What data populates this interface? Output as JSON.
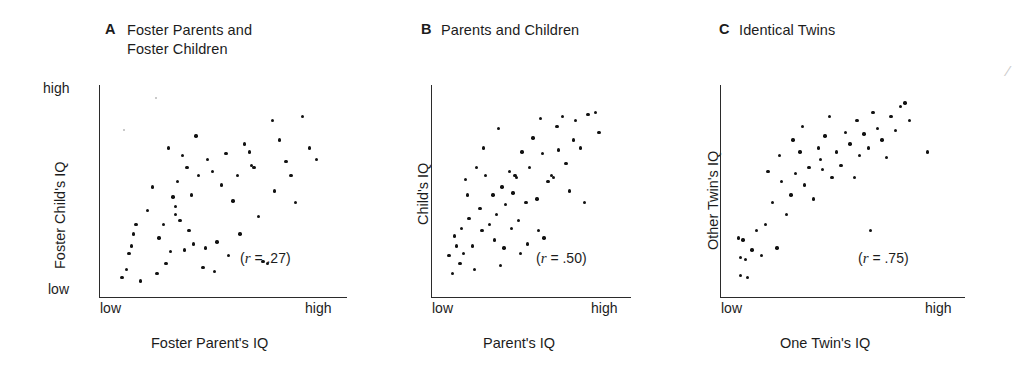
{
  "figure": {
    "background": "#ffffff",
    "ink_color": "#111111"
  },
  "panels": [
    {
      "letter": "A",
      "title": "Foster Parents and\nFoster Children",
      "ylabel": "Foster Child's IQ",
      "xlabel": "Foster Parent's IQ",
      "y_high": "high",
      "y_low": "low",
      "x_low": "low",
      "x_high": "high",
      "r_text": "(r = .27)",
      "r_value": ".27"
    },
    {
      "letter": "B",
      "title": "Parents and Children",
      "ylabel": "Child's IQ",
      "xlabel": "Parent's IQ",
      "y_high": "",
      "y_low": "",
      "x_low": "low",
      "x_high": "high",
      "r_text": "(r = .50)",
      "r_value": ".50"
    },
    {
      "letter": "C",
      "title": "Identical Twins",
      "ylabel": "Other Twin's IQ",
      "xlabel": "One Twin's IQ",
      "y_high": "",
      "y_low": "",
      "x_low": "low",
      "x_high": "high",
      "r_text": "(r = .75)",
      "r_value": ".75"
    }
  ],
  "chart_data": [
    {
      "type": "scatter",
      "panel": "A",
      "title": "Foster Parents and Foster Children",
      "xlabel": "Foster Parent's IQ",
      "ylabel": "Foster Child's IQ",
      "xlim": [
        0,
        1
      ],
      "ylim": [
        0,
        1
      ],
      "xtick_labels": [
        "low",
        "high"
      ],
      "ytick_labels": [
        "low",
        "high"
      ],
      "grid": false,
      "legend": "none",
      "annotation": "(r = .27)",
      "correlation": 0.27,
      "n": 56,
      "points": [
        [
          0.13,
          0.33
        ],
        [
          0.09,
          0.1
        ],
        [
          0.07,
          0.06
        ],
        [
          0.11,
          0.22
        ],
        [
          0.1,
          0.18
        ],
        [
          0.12,
          0.28
        ],
        [
          0.15,
          0.04
        ],
        [
          0.25,
          0.33
        ],
        [
          0.2,
          0.52
        ],
        [
          0.29,
          0.47
        ],
        [
          0.23,
          0.26
        ],
        [
          0.26,
          0.13
        ],
        [
          0.27,
          0.72
        ],
        [
          0.33,
          0.68
        ],
        [
          0.35,
          0.62
        ],
        [
          0.31,
          0.55
        ],
        [
          0.3,
          0.42
        ],
        [
          0.3,
          0.38
        ],
        [
          0.32,
          0.35
        ],
        [
          0.36,
          0.3
        ],
        [
          0.4,
          0.58
        ],
        [
          0.39,
          0.78
        ],
        [
          0.37,
          0.48
        ],
        [
          0.43,
          0.21
        ],
        [
          0.38,
          0.23
        ],
        [
          0.44,
          0.66
        ],
        [
          0.46,
          0.6
        ],
        [
          0.48,
          0.24
        ],
        [
          0.34,
          0.2
        ],
        [
          0.28,
          0.19
        ],
        [
          0.52,
          0.69
        ],
        [
          0.5,
          0.53
        ],
        [
          0.55,
          0.45
        ],
        [
          0.53,
          0.17
        ],
        [
          0.58,
          0.28
        ],
        [
          0.6,
          0.74
        ],
        [
          0.62,
          0.7
        ],
        [
          0.63,
          0.63
        ],
        [
          0.64,
          0.62
        ],
        [
          0.57,
          0.58
        ],
        [
          0.66,
          0.37
        ],
        [
          0.68,
          0.14
        ],
        [
          0.7,
          0.13
        ],
        [
          0.72,
          0.86
        ],
        [
          0.73,
          0.5
        ],
        [
          0.75,
          0.76
        ],
        [
          0.78,
          0.65
        ],
        [
          0.8,
          0.58
        ],
        [
          0.82,
          0.44
        ],
        [
          0.85,
          0.88
        ],
        [
          0.88,
          0.72
        ],
        [
          0.91,
          0.66
        ],
        [
          0.47,
          0.09
        ],
        [
          0.42,
          0.11
        ],
        [
          0.18,
          0.4
        ],
        [
          0.22,
          0.08
        ]
      ]
    },
    {
      "type": "scatter",
      "panel": "B",
      "title": "Parents and Children",
      "xlabel": "Parent's IQ",
      "ylabel": "Child's IQ",
      "xlim": [
        0,
        1
      ],
      "ylim": [
        0,
        1
      ],
      "xtick_labels": [
        "low",
        "high"
      ],
      "ytick_labels": [],
      "grid": false,
      "legend": "none",
      "annotation": "(r = .50)",
      "correlation": 0.5,
      "n": 58,
      "points": [
        [
          0.06,
          0.17
        ],
        [
          0.08,
          0.08
        ],
        [
          0.09,
          0.27
        ],
        [
          0.1,
          0.22
        ],
        [
          0.12,
          0.13
        ],
        [
          0.13,
          0.31
        ],
        [
          0.14,
          0.18
        ],
        [
          0.16,
          0.48
        ],
        [
          0.17,
          0.36
        ],
        [
          0.19,
          0.22
        ],
        [
          0.15,
          0.56
        ],
        [
          0.21,
          0.62
        ],
        [
          0.23,
          0.41
        ],
        [
          0.24,
          0.3
        ],
        [
          0.26,
          0.58
        ],
        [
          0.25,
          0.72
        ],
        [
          0.28,
          0.33
        ],
        [
          0.3,
          0.48
        ],
        [
          0.31,
          0.25
        ],
        [
          0.32,
          0.38
        ],
        [
          0.33,
          0.82
        ],
        [
          0.35,
          0.52
        ],
        [
          0.36,
          0.21
        ],
        [
          0.37,
          0.43
        ],
        [
          0.39,
          0.6
        ],
        [
          0.4,
          0.31
        ],
        [
          0.41,
          0.49
        ],
        [
          0.42,
          0.58
        ],
        [
          0.43,
          0.57
        ],
        [
          0.44,
          0.35
        ],
        [
          0.45,
          0.18
        ],
        [
          0.46,
          0.7
        ],
        [
          0.48,
          0.44
        ],
        [
          0.49,
          0.23
        ],
        [
          0.5,
          0.62
        ],
        [
          0.52,
          0.77
        ],
        [
          0.54,
          0.46
        ],
        [
          0.55,
          0.3
        ],
        [
          0.56,
          0.87
        ],
        [
          0.57,
          0.69
        ],
        [
          0.58,
          0.26
        ],
        [
          0.6,
          0.55
        ],
        [
          0.62,
          0.58
        ],
        [
          0.63,
          0.57
        ],
        [
          0.65,
          0.83
        ],
        [
          0.66,
          0.71
        ],
        [
          0.68,
          0.88
        ],
        [
          0.7,
          0.64
        ],
        [
          0.72,
          0.5
        ],
        [
          0.74,
          0.76
        ],
        [
          0.75,
          0.86
        ],
        [
          0.78,
          0.72
        ],
        [
          0.8,
          0.44
        ],
        [
          0.82,
          0.89
        ],
        [
          0.86,
          0.9
        ],
        [
          0.88,
          0.8
        ],
        [
          0.34,
          0.12
        ],
        [
          0.2,
          0.1
        ]
      ]
    },
    {
      "type": "scatter",
      "panel": "C",
      "title": "Identical Twins",
      "xlabel": "One Twin's IQ",
      "ylabel": "Other Twin's IQ",
      "xlim": [
        0,
        1
      ],
      "ylim": [
        0,
        1
      ],
      "xtick_labels": [
        "low",
        "high"
      ],
      "ytick_labels": [],
      "grid": false,
      "legend": "none",
      "annotation": "(r = .75)",
      "correlation": 0.75,
      "n": 50,
      "points": [
        [
          0.05,
          0.26
        ],
        [
          0.07,
          0.25
        ],
        [
          0.06,
          0.16
        ],
        [
          0.08,
          0.15
        ],
        [
          0.06,
          0.07
        ],
        [
          0.09,
          0.06
        ],
        [
          0.13,
          0.3
        ],
        [
          0.15,
          0.17
        ],
        [
          0.17,
          0.33
        ],
        [
          0.2,
          0.44
        ],
        [
          0.22,
          0.21
        ],
        [
          0.24,
          0.55
        ],
        [
          0.26,
          0.38
        ],
        [
          0.23,
          0.68
        ],
        [
          0.28,
          0.48
        ],
        [
          0.3,
          0.59
        ],
        [
          0.32,
          0.7
        ],
        [
          0.29,
          0.76
        ],
        [
          0.34,
          0.53
        ],
        [
          0.36,
          0.62
        ],
        [
          0.33,
          0.83
        ],
        [
          0.38,
          0.46
        ],
        [
          0.4,
          0.72
        ],
        [
          0.41,
          0.66
        ],
        [
          0.43,
          0.78
        ],
        [
          0.42,
          0.61
        ],
        [
          0.45,
          0.88
        ],
        [
          0.46,
          0.57
        ],
        [
          0.48,
          0.7
        ],
        [
          0.5,
          0.63
        ],
        [
          0.52,
          0.8
        ],
        [
          0.54,
          0.74
        ],
        [
          0.56,
          0.57
        ],
        [
          0.57,
          0.86
        ],
        [
          0.58,
          0.68
        ],
        [
          0.6,
          0.79
        ],
        [
          0.62,
          0.72
        ],
        [
          0.64,
          0.9
        ],
        [
          0.66,
          0.82
        ],
        [
          0.68,
          0.76
        ],
        [
          0.7,
          0.67
        ],
        [
          0.72,
          0.88
        ],
        [
          0.74,
          0.81
        ],
        [
          0.76,
          0.93
        ],
        [
          0.78,
          0.95
        ],
        [
          0.8,
          0.86
        ],
        [
          0.88,
          0.7
        ],
        [
          0.63,
          0.3
        ],
        [
          0.18,
          0.6
        ],
        [
          0.11,
          0.2
        ]
      ]
    }
  ]
}
